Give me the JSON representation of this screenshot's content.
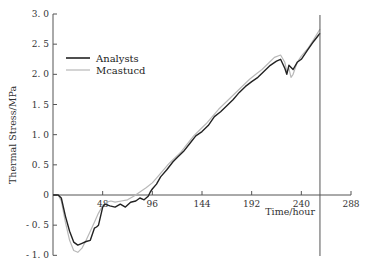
{
  "chart_data": {
    "type": "line",
    "title": "",
    "xlabel": "Time/hour",
    "ylabel": "Thermal Stress/MPa",
    "xlim": [
      0,
      288
    ],
    "ylim": [
      -1.0,
      3.0
    ],
    "x_ticks": [
      48,
      96,
      144,
      192,
      240,
      288
    ],
    "x_tick_labels": [
      "48",
      "96",
      "144",
      "192",
      "240",
      "288"
    ],
    "y_ticks": [
      3.0,
      2.5,
      2.0,
      1.5,
      1.0,
      0.5,
      0,
      -0.5,
      -1.0
    ],
    "y_tick_labels": [
      "3. 0",
      "2. 5",
      "2. 0",
      "1. 5",
      "1. 0",
      "0. 5",
      "0",
      "- 0. 5",
      "- 1. 0"
    ],
    "grid": false,
    "legend_position": "upper-left",
    "vertical_marker_x": 258,
    "series": [
      {
        "name": "Analysts",
        "color": "#222222",
        "x": [
          0,
          5,
          8,
          12,
          16,
          20,
          24,
          28,
          32,
          36,
          40,
          42,
          44,
          48,
          50,
          55,
          60,
          65,
          70,
          75,
          80,
          84,
          88,
          92,
          94,
          96,
          100,
          104,
          110,
          116,
          120,
          126,
          132,
          138,
          144,
          150,
          156,
          162,
          168,
          174,
          180,
          186,
          192,
          198,
          204,
          210,
          216,
          220,
          224,
          226,
          228,
          232,
          236,
          240,
          246,
          252,
          258
        ],
        "values": [
          0,
          0,
          -0.05,
          -0.35,
          -0.6,
          -0.78,
          -0.83,
          -0.8,
          -0.77,
          -0.75,
          -0.55,
          -0.53,
          -0.5,
          -0.2,
          -0.15,
          -0.18,
          -0.2,
          -0.15,
          -0.2,
          -0.12,
          -0.1,
          -0.05,
          -0.08,
          -0.02,
          0.05,
          0.1,
          0.18,
          0.3,
          0.42,
          0.55,
          0.62,
          0.72,
          0.85,
          0.98,
          1.05,
          1.15,
          1.3,
          1.38,
          1.48,
          1.58,
          1.7,
          1.8,
          1.88,
          1.95,
          2.05,
          2.15,
          2.22,
          2.25,
          2.1,
          2.0,
          2.15,
          2.08,
          2.2,
          2.25,
          2.4,
          2.55,
          2.68
        ]
      },
      {
        "name": "Mcastucd",
        "color": "#b8b8b8",
        "x": [
          0,
          5,
          8,
          12,
          16,
          20,
          24,
          28,
          32,
          36,
          40,
          44,
          48,
          52,
          56,
          60,
          66,
          72,
          78,
          84,
          90,
          96,
          100,
          106,
          112,
          118,
          124,
          130,
          136,
          142,
          148,
          154,
          160,
          166,
          172,
          178,
          184,
          190,
          196,
          202,
          208,
          214,
          220,
          224,
          226,
          228,
          230,
          232,
          236,
          240,
          246,
          252,
          258
        ],
        "values": [
          0,
          0,
          -0.1,
          -0.45,
          -0.75,
          -0.92,
          -0.95,
          -0.88,
          -0.75,
          -0.6,
          -0.45,
          -0.3,
          -0.18,
          -0.12,
          -0.1,
          -0.12,
          -0.1,
          -0.08,
          -0.02,
          0.05,
          0.12,
          0.2,
          0.28,
          0.4,
          0.52,
          0.62,
          0.72,
          0.85,
          0.98,
          1.08,
          1.18,
          1.3,
          1.42,
          1.52,
          1.62,
          1.72,
          1.82,
          1.92,
          2.0,
          2.08,
          2.18,
          2.28,
          2.32,
          2.2,
          2.05,
          2.1,
          1.95,
          2.0,
          2.2,
          2.3,
          2.42,
          2.58,
          2.75
        ]
      }
    ]
  },
  "legend": {
    "items": [
      {
        "label": "Analysts",
        "color": "#222222"
      },
      {
        "label": "Mcastucd",
        "color": "#b8b8b8"
      }
    ]
  }
}
